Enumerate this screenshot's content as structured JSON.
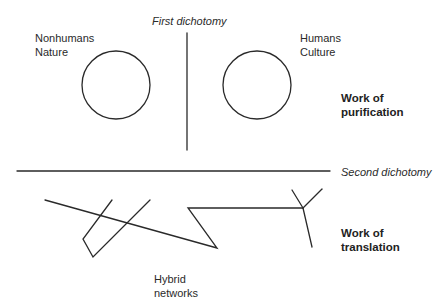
{
  "diagram": {
    "labels": {
      "first_dichotomy": "First dichotomy",
      "second_dichotomy": "Second dichotomy",
      "nonhumans": "Nonhumans",
      "nature": "Nature",
      "humans": "Humans",
      "culture": "Culture",
      "work_of": "Work of",
      "purification": "purification",
      "work_of_2": "Work of",
      "translation": "translation",
      "hybrid": "Hybrid",
      "networks": "networks"
    },
    "colors": {
      "line": "#2a2a2a",
      "text": "#2a2a2a",
      "background": "#ffffff"
    }
  }
}
